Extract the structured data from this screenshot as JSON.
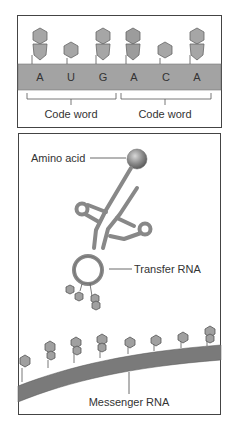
{
  "panel_top": {
    "bases": [
      "A",
      "U",
      "G",
      "A",
      "C",
      "A"
    ],
    "codon_labels": [
      "Code word",
      "Code word"
    ]
  },
  "panel_bottom": {
    "labels": {
      "amino_acid": "Amino acid",
      "transfer_rna": "Transfer RNA",
      "messenger_rna": "Messenger RNA"
    }
  },
  "colors": {
    "strand": "#9a9a9a",
    "strand_dark": "#6e6e6e",
    "base_fill": "#a6a6a6",
    "base_stroke": "#666666",
    "border": "#444444",
    "amino_acid": "#888888"
  }
}
